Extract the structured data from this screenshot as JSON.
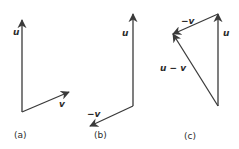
{
  "colors": {
    "stroke": "#3a3a3a",
    "text": "#2b2b2b",
    "background": "#ffffff"
  },
  "panels": [
    {
      "caption": "(a)",
      "vectors": [
        {
          "label": "u",
          "from": [
            22,
            112
          ],
          "to": [
            22,
            20
          ]
        },
        {
          "label": "v",
          "from": [
            22,
            112
          ],
          "to": [
            69,
            92
          ]
        }
      ]
    },
    {
      "caption": "(b)",
      "vectors": [
        {
          "label": "u",
          "from": [
            133,
            106
          ],
          "to": [
            133,
            14
          ]
        },
        {
          "label": "−v",
          "from": [
            133,
            106
          ],
          "to": [
            90,
            126
          ]
        }
      ]
    },
    {
      "caption": "(c)",
      "vectors": [
        {
          "label": "u",
          "from": [
            218,
            106
          ],
          "to": [
            218,
            14
          ]
        },
        {
          "label": "−v",
          "from": [
            218,
            14
          ],
          "to": [
            173,
            34
          ]
        },
        {
          "label": "u − v",
          "from": [
            218,
            106
          ],
          "to": [
            173,
            34
          ]
        }
      ]
    }
  ]
}
